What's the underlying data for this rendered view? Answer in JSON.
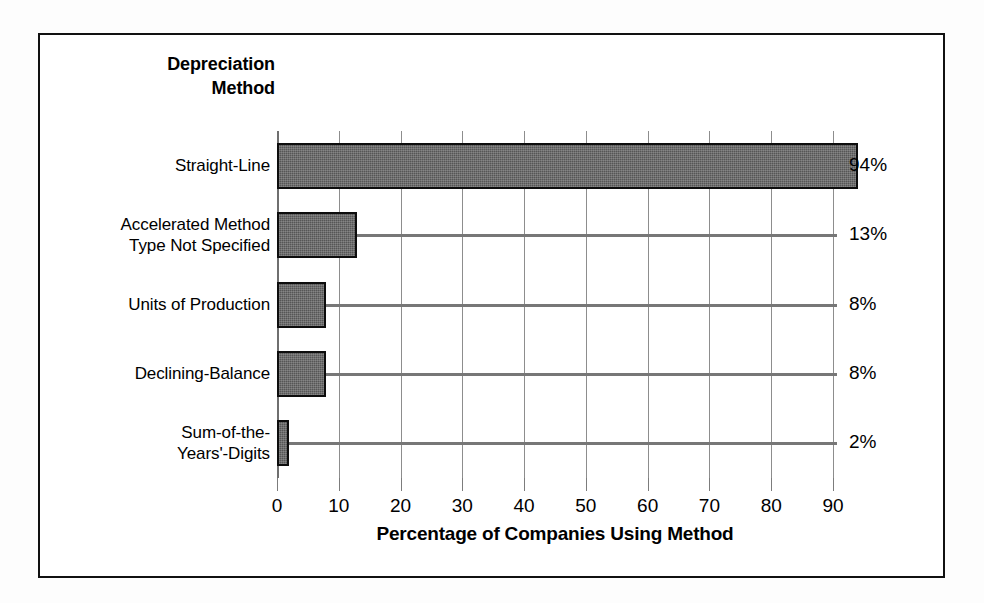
{
  "figure": {
    "frame_color": "#111111",
    "bar_fill_color": "#565656",
    "bar_edge_color": "#0d0d0d",
    "gridline_color": "#8d8d8d",
    "leader_color": "#777777"
  },
  "chart_data": {
    "type": "bar",
    "orientation": "horizontal",
    "title": "",
    "category_axis_title_line1": "Depreciation",
    "category_axis_title_line2": "Method",
    "xlabel": "Percentage of Companies Using Method",
    "ylabel": "Depreciation Method",
    "xlim": [
      0,
      90
    ],
    "xticks": [
      0,
      10,
      20,
      30,
      40,
      50,
      60,
      70,
      80,
      90
    ],
    "xticklabels": [
      "0",
      "10",
      "20",
      "30",
      "40",
      "50",
      "60",
      "70",
      "80",
      "90"
    ],
    "grid": true,
    "grid_axis": "x",
    "legend": false,
    "value_label_suffix": "%",
    "categories": [
      "Straight-Line",
      "Accelerated Method Type Not Specified",
      "Units of Production",
      "Declining-Balance",
      "Sum-of-the-Years'-Digits"
    ],
    "category_label_lines": [
      [
        "Straight-Line"
      ],
      [
        "Accelerated Method",
        "Type Not Specified"
      ],
      [
        "Units of Production"
      ],
      [
        "Declining-Balance"
      ],
      [
        "Sum-of-the-",
        "Years'-Digits"
      ]
    ],
    "values": [
      94,
      13,
      8,
      8,
      2
    ],
    "value_labels": [
      "94%",
      "13%",
      "8%",
      "8%",
      "2%"
    ]
  },
  "bars": [
    {
      "label": "Straight-Line",
      "value": 94,
      "value_label": "94%"
    },
    {
      "label": "Accelerated Method Type Not Specified",
      "value": 13,
      "value_label": "13%"
    },
    {
      "label": "Units of Production",
      "value": 8,
      "value_label": "8%"
    },
    {
      "label": "Declining-Balance",
      "value": 8,
      "value_label": "8%"
    },
    {
      "label": "Sum-of-the-Years'-Digits",
      "value": 2,
      "value_label": "2%"
    }
  ]
}
